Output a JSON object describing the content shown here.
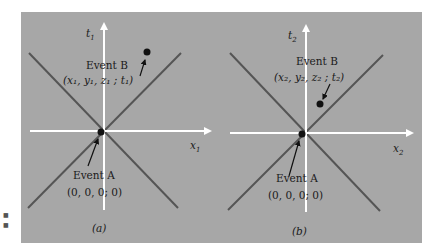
{
  "figure": {
    "background_color": "#a7a7a7",
    "light_cone_color": "#555555",
    "axis_color": "#ffffff",
    "event_dot_color": "#111111"
  },
  "panels": [
    {
      "id": "a",
      "caption": "(a)",
      "time_axis_label": "t",
      "time_axis_sub": "1",
      "space_axis_label": "x",
      "space_axis_sub": "1",
      "event_b": {
        "title": "Event B",
        "coords": "(x₁, y₁, z₁ ; t₁)"
      },
      "event_a": {
        "title": "Event A",
        "coords": "(0, 0, 0; 0)"
      }
    },
    {
      "id": "b",
      "caption": "(b)",
      "time_axis_label": "t",
      "time_axis_sub": "2",
      "space_axis_label": "x",
      "space_axis_sub": "2",
      "event_b": {
        "title": "Event B",
        "coords": "(x₂, y₂, z₂ ; t₂)"
      },
      "event_a": {
        "title": "Event A",
        "coords": "(0, 0, 0; 0)"
      }
    }
  ]
}
